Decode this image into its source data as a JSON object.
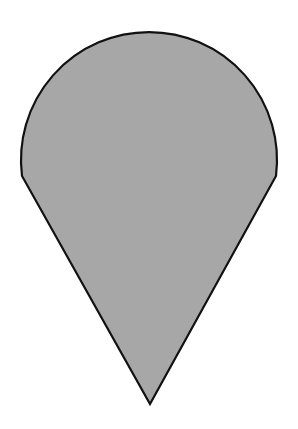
{
  "figure": {
    "type": "geometric-shape",
    "shape_name": "circular-sector-cone",
    "colors": {
      "fill": "#a7a7a7",
      "stroke": "#111111",
      "background": "#ffffff"
    },
    "geometry": {
      "arc_left_point": [
        22,
        176
      ],
      "arc_right_point": [
        276,
        176
      ],
      "arc_top_y": 44,
      "tip_point": [
        150,
        404
      ],
      "arc_radius": 128
    }
  }
}
